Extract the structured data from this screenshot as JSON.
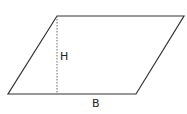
{
  "diagram": {
    "shape": "parallelogram",
    "vertices": {
      "top_left": [
        57,
        16
      ],
      "top_right": [
        184,
        16
      ],
      "bottom_right": [
        136,
        94
      ],
      "bottom_left": [
        8,
        94
      ]
    },
    "height_line": {
      "x": 57,
      "y1": 16,
      "y2": 94,
      "style": "dashed"
    },
    "labels": {
      "height": "H",
      "base": "B"
    },
    "colors": {
      "stroke": "#333333",
      "dash": "#666666",
      "text": "#222222"
    }
  }
}
